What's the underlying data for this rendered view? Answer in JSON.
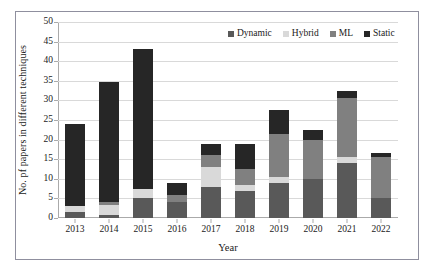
{
  "chart_data": {
    "type": "bar",
    "stacked": true,
    "title": "",
    "xlabel": "Year",
    "ylabel": "No. pf papers in different techniques",
    "categories": [
      "2013",
      "2014",
      "2015",
      "2016",
      "2017",
      "2018",
      "2019",
      "2020",
      "2021",
      "2022"
    ],
    "ylim": [
      0,
      50
    ],
    "yticks": [
      0,
      5,
      10,
      15,
      20,
      25,
      30,
      35,
      40,
      45,
      50
    ],
    "grid": "horizontal",
    "legend_position": "top-right",
    "series": [
      {
        "name": "Dynamic",
        "color": "#595959",
        "values": [
          1.5,
          0.8,
          5,
          4,
          8,
          7,
          9,
          10,
          14,
          5
        ]
      },
      {
        "name": "Hybrid",
        "color": "#d9d9d9",
        "values": [
          1.5,
          2.5,
          2.5,
          0,
          5,
          1.5,
          1.5,
          0,
          1.5,
          0
        ]
      },
      {
        "name": "ML",
        "color": "#808080",
        "values": [
          0,
          0.7,
          0,
          2,
          3,
          4,
          11,
          10,
          15,
          10.5
        ]
      },
      {
        "name": "Static",
        "color": "#262626",
        "values": [
          21,
          30.8,
          35.5,
          3,
          3,
          6.3,
          6,
          2.5,
          2,
          1
        ]
      }
    ],
    "totals": [
      24,
      34.8,
      43,
      9,
      19,
      18.8,
      27.5,
      22.5,
      32.5,
      16.5
    ]
  },
  "legend": {
    "items": [
      {
        "label": "Dynamic",
        "color": "#595959"
      },
      {
        "label": "Hybrid",
        "color": "#d9d9d9"
      },
      {
        "label": "ML",
        "color": "#808080"
      },
      {
        "label": "Static",
        "color": "#262626"
      }
    ]
  },
  "axes": {
    "y_title": "No. pf papers in different techniques",
    "x_title": "Year"
  }
}
